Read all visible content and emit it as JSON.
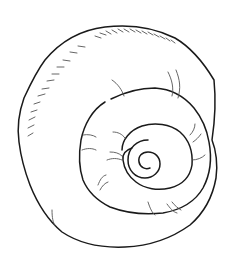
{
  "image": {
    "subject": "spiral shell line drawing",
    "background_color": "#ffffff",
    "stroke_color": "#1a1a1a",
    "hatch_color": "#555555"
  }
}
